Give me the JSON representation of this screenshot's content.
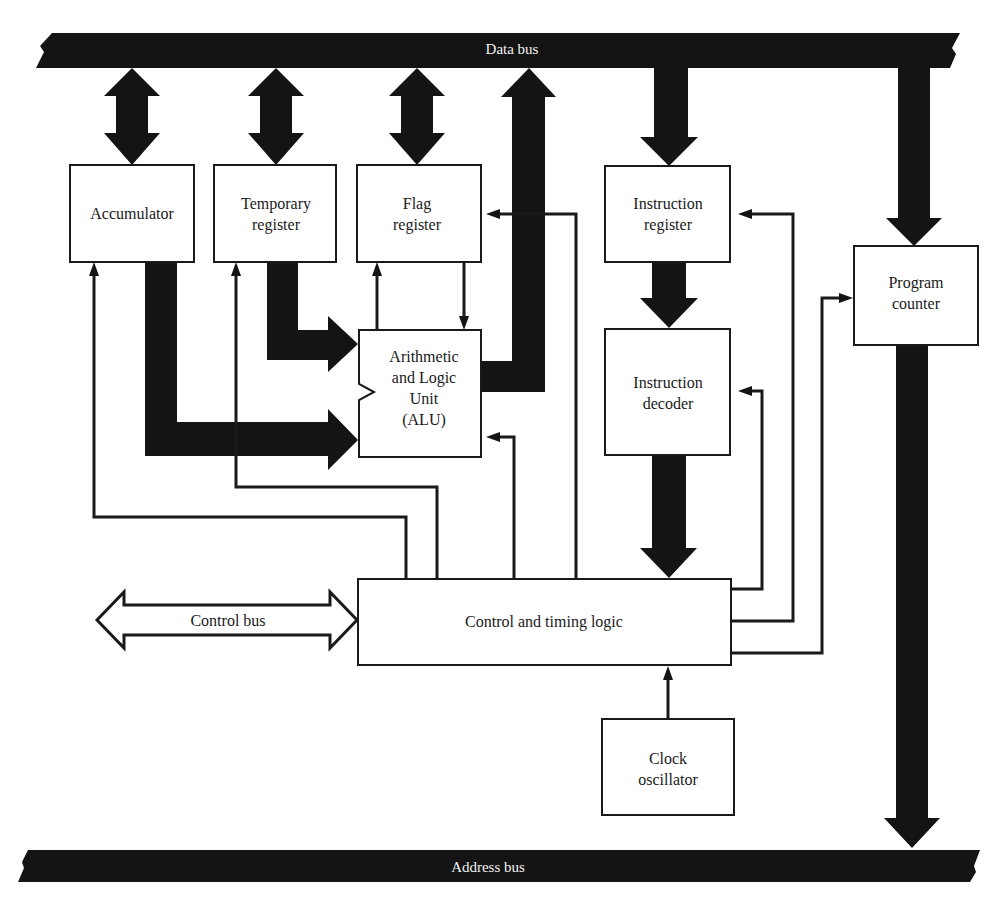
{
  "buses": {
    "data_bus": "Data bus",
    "address_bus": "Address bus",
    "control_bus": "Control bus"
  },
  "blocks": {
    "accumulator": {
      "line1": "Accumulator"
    },
    "temporary_register": {
      "line1": "Temporary",
      "line2": "register"
    },
    "flag_register": {
      "line1": "Flag",
      "line2": "register"
    },
    "alu": {
      "line1": "Arithmetic",
      "line2": "and Logic",
      "line3": "Unit",
      "line4": "(ALU)"
    },
    "instruction_register": {
      "line1": "Instruction",
      "line2": "register"
    },
    "instruction_decoder": {
      "line1": "Instruction",
      "line2": "decoder"
    },
    "program_counter": {
      "line1": "Program",
      "line2": "counter"
    },
    "control_timing": {
      "line1": "Control and timing logic"
    },
    "clock_oscillator": {
      "line1": "Clock",
      "line2": "oscillator"
    }
  },
  "colors": {
    "ink": "#141414",
    "paper": "#ffffff",
    "bus_text": "#f2f2f2"
  }
}
